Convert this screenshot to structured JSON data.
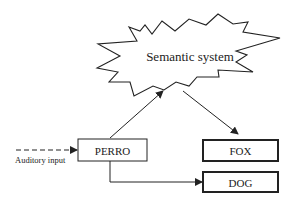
{
  "diagram": {
    "semantic_system": {
      "label": "Semantic system",
      "shape": "starburst"
    },
    "nodes": [
      {
        "id": "perro",
        "label": "PERRO",
        "border": "thin"
      },
      {
        "id": "fox",
        "label": "FOX",
        "border": "thick"
      },
      {
        "id": "dog",
        "label": "DOG",
        "border": "thick"
      }
    ],
    "input": {
      "label": "Auditory input",
      "line_style": "dashed"
    },
    "edges": [
      {
        "from": "auditory-input",
        "to": "perro",
        "style": "dashed"
      },
      {
        "from": "perro",
        "to": "semantic-system",
        "style": "solid"
      },
      {
        "from": "semantic-system",
        "to": "fox",
        "style": "solid"
      },
      {
        "from": "perro",
        "to": "dog",
        "style": "solid-elbow"
      }
    ],
    "colors": {
      "stroke": "#222222",
      "background": "#ffffff"
    }
  }
}
